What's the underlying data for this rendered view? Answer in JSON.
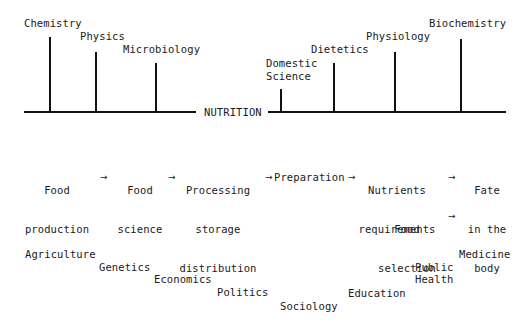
{
  "diagram": {
    "center_label": "NUTRITION",
    "upper_left_disciplines": [
      {
        "label": "Chemistry"
      },
      {
        "label": "Physics"
      },
      {
        "label": "Microbiology"
      }
    ],
    "upper_right_disciplines": [
      {
        "label_line1": "Domestic",
        "label_line2": "Science"
      },
      {
        "label": "Dietetics"
      },
      {
        "label": "Physiology"
      },
      {
        "label": "Biochemistry"
      }
    ],
    "food_chain": [
      {
        "line1": "Food",
        "line2": "production"
      },
      {
        "line1": "Food",
        "line2": "science"
      },
      {
        "line1": "Processing",
        "line2": "storage",
        "line3": "distribution"
      },
      {
        "line1": "Preparation"
      },
      {
        "line1": "Nutrients",
        "line2": "requirements"
      },
      {
        "line1": "Fate",
        "line2": "in the",
        "line3": "body"
      }
    ],
    "food_selection": {
      "line1": "Food",
      "line2": "selection"
    },
    "arrow_glyph": "→",
    "lower_disciplines": [
      {
        "label": "Agriculture"
      },
      {
        "label": "Genetics"
      },
      {
        "label": "Economics"
      },
      {
        "label": "Politics"
      },
      {
        "label": "Sociology"
      },
      {
        "label": "Education"
      },
      {
        "label_line1": "Public",
        "label_line2": "Health"
      },
      {
        "label": "Medicine"
      }
    ]
  }
}
